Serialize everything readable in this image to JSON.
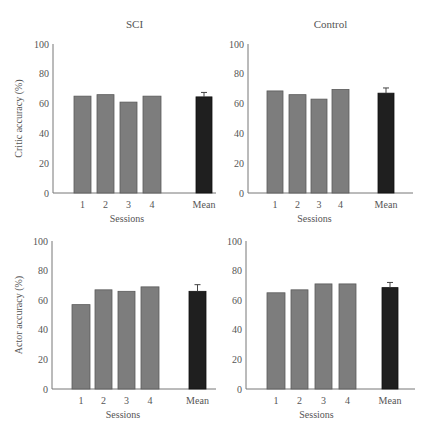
{
  "colors": {
    "session_bar": "#7d7d7d",
    "session_bar_edge": "#5a5a5a",
    "mean_bar": "#1f1f1f",
    "axis": "#777777",
    "text": "#555555"
  },
  "chart_data": [
    {
      "type": "bar",
      "panel": "top-left",
      "title": "SCI",
      "xlabel": "Sessions",
      "ylabel": "Critic accuracy (%)",
      "ylim": [
        0,
        100
      ],
      "yticks": [
        0,
        20,
        40,
        60,
        80,
        100
      ],
      "grid": false,
      "categories": [
        "1",
        "2",
        "3",
        "4",
        "Mean"
      ],
      "values": [
        65,
        66,
        61,
        65,
        64.5
      ],
      "mean_error": 3,
      "layout": {
        "x0": 53,
        "y0": 193,
        "ytop": 44,
        "xend": 216,
        "bars": [
          [
            74,
            17
          ],
          [
            97,
            17
          ],
          [
            120,
            17
          ],
          [
            143,
            18
          ],
          [
            196,
            16
          ]
        ]
      }
    },
    {
      "type": "bar",
      "panel": "top-right",
      "title": "Control",
      "xlabel": "Sessions",
      "ylabel": "",
      "ylim": [
        0,
        100
      ],
      "yticks": [
        0,
        20,
        40,
        60,
        80,
        100
      ],
      "grid": false,
      "categories": [
        "1",
        "2",
        "3",
        "4",
        "Mean"
      ],
      "values": [
        68.5,
        66,
        63,
        69.5,
        67
      ],
      "mean_error": 3.5,
      "layout": {
        "x0": 248,
        "y0": 193,
        "ytop": 44,
        "xend": 413,
        "bars": [
          [
            267,
            16
          ],
          [
            289,
            17
          ],
          [
            311,
            16
          ],
          [
            332,
            17
          ],
          [
            378,
            16
          ]
        ]
      }
    },
    {
      "type": "bar",
      "panel": "bottom-left",
      "title": "",
      "xlabel": "Sessions",
      "ylabel": "Actor accuracy (%)",
      "ylim": [
        0,
        100
      ],
      "yticks": [
        0,
        20,
        40,
        60,
        80,
        100
      ],
      "grid": false,
      "categories": [
        "1",
        "2",
        "3",
        "4",
        "Mean"
      ],
      "values": [
        57,
        67,
        66,
        69,
        66
      ],
      "mean_error": 4.5,
      "layout": {
        "x0": 52,
        "y0": 389,
        "ytop": 241,
        "xend": 216,
        "bars": [
          [
            72,
            18
          ],
          [
            95,
            17
          ],
          [
            118,
            17
          ],
          [
            141,
            18
          ],
          [
            189,
            17
          ]
        ]
      }
    },
    {
      "type": "bar",
      "panel": "bottom-right",
      "title": "",
      "xlabel": "Sessions",
      "ylabel": "",
      "ylim": [
        0,
        100
      ],
      "yticks": [
        0,
        20,
        40,
        60,
        80,
        100
      ],
      "grid": false,
      "categories": [
        "1",
        "2",
        "3",
        "4",
        "Mean"
      ],
      "values": [
        65,
        67,
        71,
        71,
        68.5
      ],
      "mean_error": 3.5,
      "layout": {
        "x0": 246,
        "y0": 389,
        "ytop": 241,
        "xend": 415,
        "bars": [
          [
            267,
            18
          ],
          [
            291,
            17
          ],
          [
            315,
            17
          ],
          [
            339,
            17
          ],
          [
            382,
            16
          ]
        ]
      }
    }
  ]
}
